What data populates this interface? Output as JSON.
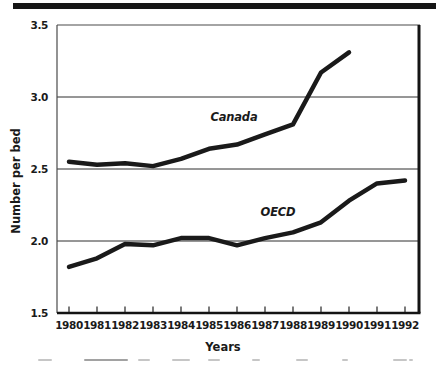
{
  "figure": {
    "background": "#ffffff",
    "top_rule_color": "#161616"
  },
  "chart_data": {
    "type": "line",
    "title": "",
    "xlabel": "Years",
    "ylabel": "Number per bed",
    "categories": [
      1980,
      1981,
      1982,
      1983,
      1984,
      1985,
      1986,
      1987,
      1988,
      1989,
      1990,
      1991,
      1992
    ],
    "xtick_labels": [
      "1980",
      "1981",
      "1982",
      "1983",
      "1984",
      "1985",
      "1986",
      "1987",
      "1988",
      "1989",
      "1990",
      "1991",
      "1992"
    ],
    "yticks": [
      1.5,
      2.0,
      2.5,
      3.0,
      3.5
    ],
    "ytick_labels": [
      "1.5",
      "2.0",
      "2.5",
      "3.0",
      "3.5"
    ],
    "ylim": [
      1.5,
      3.5
    ],
    "grid": true,
    "legend_position": "inline-labels-on-plot",
    "line_color": "#1a1a1a",
    "line_width": 4.5,
    "series": [
      {
        "name": "Canada",
        "x": [
          1980,
          1981,
          1982,
          1983,
          1984,
          1985,
          1986,
          1987,
          1988,
          1989,
          1990
        ],
        "values": [
          2.55,
          2.53,
          2.54,
          2.52,
          2.57,
          2.64,
          2.67,
          2.74,
          2.81,
          3.17,
          3.31
        ]
      },
      {
        "name": "OECD",
        "x": [
          1980,
          1981,
          1982,
          1983,
          1984,
          1985,
          1986,
          1987,
          1988,
          1989,
          1990,
          1991,
          1992
        ],
        "values": [
          1.82,
          1.88,
          1.98,
          1.97,
          2.02,
          2.02,
          1.97,
          2.02,
          2.06,
          2.13,
          2.28,
          2.4,
          2.42
        ]
      }
    ]
  }
}
